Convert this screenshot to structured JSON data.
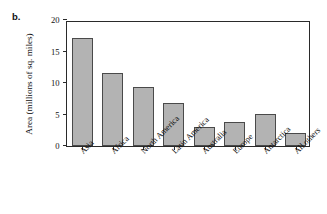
{
  "figure": {
    "panel_letter": "b."
  },
  "chart_data": {
    "type": "bar",
    "title": "",
    "xlabel": "",
    "ylabel": "Area (millions of sq. miles)",
    "categories": [
      "Asia",
      "Africa",
      "North America",
      "Latin America",
      "Australia",
      "Europe",
      "Antarctica",
      "All others"
    ],
    "values": [
      17.2,
      11.6,
      9.3,
      6.9,
      3.0,
      3.8,
      5.1,
      2.0
    ],
    "ylim": [
      0,
      20
    ],
    "yticks": [
      0,
      5,
      10,
      15,
      20
    ],
    "ytick_labels": [
      "0",
      "5",
      "10",
      "15",
      "20"
    ],
    "grid": false,
    "legend": null,
    "bar_fill_color": "#b3b3b3",
    "bar_edge_color": "#4a4a4a",
    "axis_color": "#2a2a2a"
  }
}
